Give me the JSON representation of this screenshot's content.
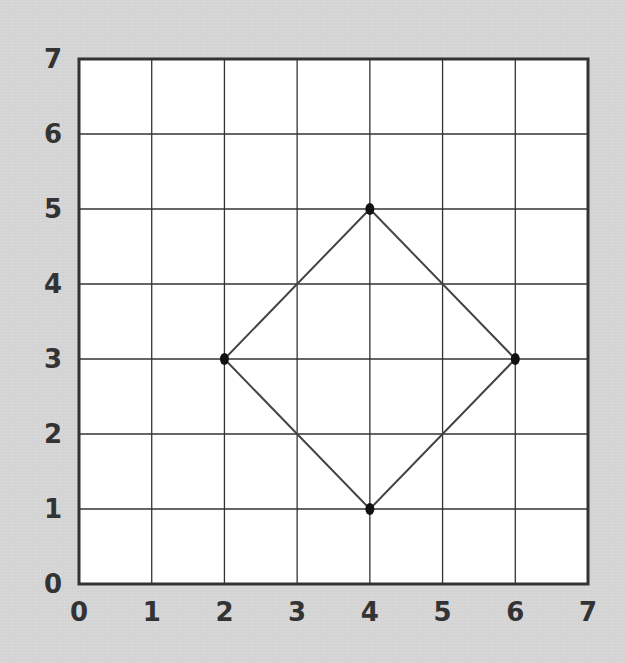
{
  "chart_data": {
    "type": "scatter",
    "title": "",
    "xlabel": "",
    "ylabel": "",
    "xlim": [
      0,
      7
    ],
    "ylim": [
      0,
      7
    ],
    "grid": true,
    "x_ticks": [
      "0",
      "1",
      "2",
      "3",
      "4",
      "5",
      "6",
      "7"
    ],
    "y_ticks": [
      "0",
      "1",
      "2",
      "3",
      "4",
      "5",
      "6",
      "7"
    ],
    "series": [
      {
        "name": "square",
        "closed": true,
        "points": [
          {
            "x": 4,
            "y": 5
          },
          {
            "x": 6,
            "y": 3
          },
          {
            "x": 4,
            "y": 1
          },
          {
            "x": 2,
            "y": 3
          }
        ]
      }
    ],
    "colors": {
      "background": "#d4d4d4",
      "plot_area": "#ffffff",
      "grid": "#333333",
      "shape": "#444444",
      "points": "#111111",
      "labels": "#333333"
    }
  }
}
